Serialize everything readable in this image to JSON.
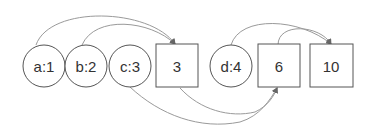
{
  "diagram": {
    "nodes": [
      {
        "id": "a",
        "label": "a:1",
        "shape": "circle"
      },
      {
        "id": "b",
        "label": "b:2",
        "shape": "circle"
      },
      {
        "id": "c",
        "label": "c:3",
        "shape": "circle"
      },
      {
        "id": "s3",
        "label": "3",
        "shape": "square"
      },
      {
        "id": "d",
        "label": "d:4",
        "shape": "circle"
      },
      {
        "id": "s6",
        "label": "6",
        "shape": "square"
      },
      {
        "id": "s10",
        "label": "10",
        "shape": "square"
      }
    ],
    "edges": [
      {
        "from": "a",
        "to": "s3"
      },
      {
        "from": "b",
        "to": "s3"
      },
      {
        "from": "c",
        "to": "s6"
      },
      {
        "from": "s3",
        "to": "s6"
      },
      {
        "from": "d",
        "to": "s10"
      },
      {
        "from": "s6",
        "to": "s10"
      }
    ],
    "colors": {
      "stroke": "#555555",
      "edge": "#9a9a9a",
      "text": "#333333"
    }
  }
}
